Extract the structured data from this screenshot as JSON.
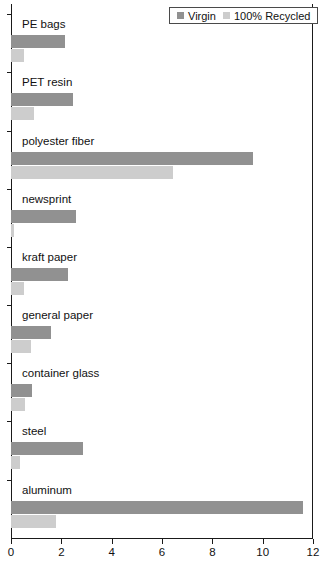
{
  "chart_data": {
    "type": "bar",
    "orientation": "horizontal",
    "title": "",
    "xlabel": "",
    "ylabel": "",
    "xlim": [
      0,
      12
    ],
    "xticks": [
      0,
      2,
      4,
      6,
      8,
      10,
      12
    ],
    "xtick_labels": [
      "0",
      "2",
      "4",
      "6",
      "8",
      "10",
      "12"
    ],
    "grid": false,
    "legend_position": "top-right",
    "categories": [
      "PE bags",
      "PET resin",
      "polyester fiber",
      "newsprint",
      "kraft paper",
      "general paper",
      "container glass",
      "steel",
      "aluminum"
    ],
    "series": [
      {
        "name": "Virgin",
        "color": "#919191",
        "values": [
          2.15,
          2.45,
          9.6,
          2.6,
          2.25,
          1.6,
          0.85,
          2.85,
          11.6
        ]
      },
      {
        "name": "100% Recycled",
        "color": "#cdcdcd",
        "values": [
          0.5,
          0.9,
          6.45,
          0.1,
          0.5,
          0.8,
          0.55,
          0.35,
          1.8
        ]
      }
    ]
  },
  "legend": {
    "entries": [
      {
        "label": "Virgin",
        "color": "#919191"
      },
      {
        "label": "100% Recycled",
        "color": "#cdcdcd"
      }
    ]
  },
  "colors": {
    "virgin": "#919191",
    "recycled": "#cdcdcd",
    "axis": "#1a1a1a",
    "text": "#111111",
    "background": "#ffffff"
  }
}
